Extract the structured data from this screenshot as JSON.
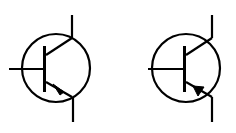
{
  "diagram": {
    "type": "transistor-symbols",
    "stroke_color": "#000000",
    "background": "#ffffff",
    "symbols": [
      {
        "name": "npn-transistor",
        "arrow": "outward"
      },
      {
        "name": "pnp-transistor",
        "arrow": "inward"
      }
    ]
  }
}
